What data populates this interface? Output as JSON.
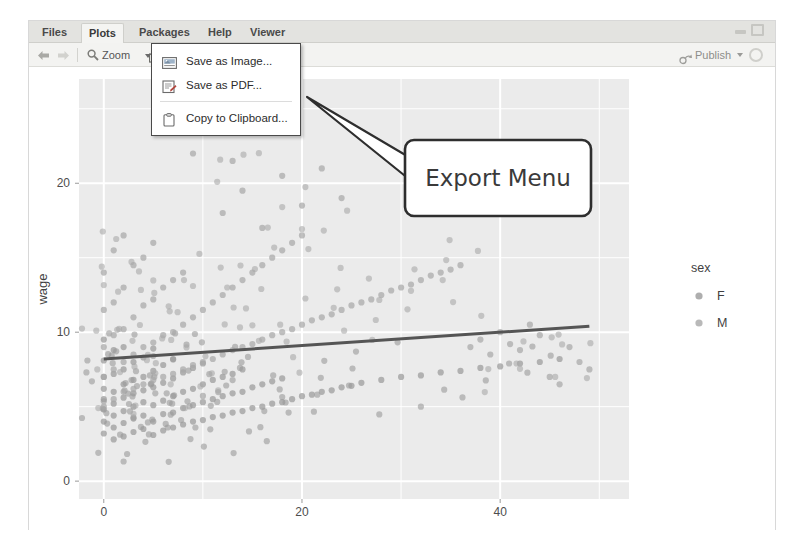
{
  "window": {
    "minimize_label": "minimize",
    "maximize_label": "maximize"
  },
  "tabs": [
    {
      "label": "Files",
      "active": false
    },
    {
      "label": "Plots",
      "active": true
    },
    {
      "label": "Packages",
      "active": false
    },
    {
      "label": "Help",
      "active": false
    },
    {
      "label": "Viewer",
      "active": false
    }
  ],
  "toolbar": {
    "back_icon": "back-arrow-icon",
    "forward_icon": "forward-arrow-icon",
    "zoom_icon": "magnifier-icon",
    "zoom_label": "Zoom",
    "export_icon": "export-icon",
    "export_label": "Export",
    "export_caret": "caret-down-icon",
    "remove_icon": "remove-plot-icon",
    "clear_icon": "clear-all-plots-icon",
    "publish_icon": "publish-icon",
    "publish_label": "Publish",
    "publish_caret": "caret-down-icon",
    "refresh_icon": "refresh-icon"
  },
  "export_menu": {
    "open": true,
    "items": [
      {
        "label": "Save as Image...",
        "icon": "image-file-icon"
      },
      {
        "label": "Save as PDF...",
        "icon": "pdf-file-icon"
      },
      {
        "label": "Copy to Clipboard...",
        "icon": "clipboard-icon"
      }
    ]
  },
  "annotation": {
    "label": "Export Menu"
  },
  "colors": {
    "panel_bg": "#ebebeb",
    "grid": "#ffffff",
    "point": "#9a9a9a",
    "trend_line": "#555555",
    "axis_text": "#4d4d4d",
    "toolbar_bg": "#f3f3f1",
    "tabbar_bg": "#e3e3e0"
  },
  "chart_data": {
    "type": "scatter",
    "title": "",
    "xlabel": "exper",
    "ylabel": "wage",
    "xlim": [
      -2.5,
      53
    ],
    "ylim": [
      -1.2,
      27
    ],
    "xticks": [
      0,
      20,
      40
    ],
    "yticks": [
      0,
      10,
      20
    ],
    "grid": true,
    "legend": {
      "title": "sex",
      "position": "right",
      "entries": [
        {
          "label": "F",
          "color": "#9a9a9a"
        },
        {
          "label": "M",
          "color": "#a8a8a8"
        }
      ]
    },
    "trend_line": {
      "type": "linear-fit",
      "x_start": 0,
      "y_start": 8.2,
      "x_end": 49,
      "y_end": 10.4,
      "color": "#555555"
    },
    "series": [
      {
        "name": "F",
        "color": "#9a9a9a",
        "x": [
          0,
          0,
          0,
          0,
          0,
          0,
          0,
          0,
          1,
          1,
          1,
          1,
          1,
          1,
          1,
          2,
          2,
          2,
          2,
          2,
          2,
          2,
          3,
          3,
          3,
          3,
          3,
          3,
          4,
          4,
          4,
          4,
          4,
          4,
          5,
          5,
          5,
          5,
          5,
          5,
          6,
          6,
          6,
          6,
          6,
          7,
          7,
          7,
          7,
          7,
          8,
          8,
          8,
          8,
          9,
          9,
          9,
          9,
          10,
          10,
          10,
          10,
          11,
          11,
          11,
          12,
          12,
          12,
          13,
          13,
          13,
          14,
          14,
          14,
          15,
          15,
          16,
          16,
          17,
          17,
          18,
          18,
          19,
          20,
          21,
          22,
          23,
          24,
          25,
          26,
          28,
          30,
          32,
          34,
          36,
          38,
          40,
          42,
          44,
          46
        ],
        "y": [
          3.2,
          4.0,
          4.8,
          5.5,
          6.2,
          7.0,
          8.1,
          9.5,
          2.8,
          3.6,
          4.4,
          5.2,
          6.0,
          7.2,
          8.8,
          3.0,
          3.9,
          4.7,
          5.6,
          6.5,
          7.5,
          9.0,
          3.3,
          4.2,
          5.0,
          5.9,
          6.8,
          8.0,
          3.5,
          4.4,
          5.3,
          6.1,
          7.0,
          8.3,
          3.1,
          4.0,
          5.1,
          6.3,
          7.4,
          8.9,
          3.4,
          4.5,
          5.4,
          6.6,
          7.8,
          3.6,
          4.6,
          5.7,
          6.9,
          8.2,
          3.8,
          4.9,
          6.0,
          7.3,
          4.0,
          5.1,
          6.2,
          7.6,
          4.1,
          5.3,
          6.5,
          7.9,
          4.3,
          5.5,
          6.8,
          4.4,
          5.7,
          7.0,
          4.6,
          5.9,
          7.2,
          4.7,
          6.0,
          7.5,
          4.9,
          6.3,
          5.0,
          6.5,
          5.2,
          6.7,
          5.3,
          6.9,
          5.5,
          5.7,
          5.8,
          6.0,
          6.1,
          6.3,
          6.4,
          6.6,
          6.8,
          7.0,
          7.1,
          7.3,
          7.4,
          7.6,
          7.7,
          7.9,
          8.0,
          8.2
        ]
      },
      {
        "name": "M",
        "color": "#a8a8a8",
        "x": [
          0,
          0,
          0,
          0,
          0,
          1,
          1,
          1,
          1,
          1,
          2,
          2,
          2,
          2,
          2,
          3,
          3,
          3,
          3,
          4,
          4,
          4,
          4,
          5,
          5,
          5,
          5,
          6,
          6,
          6,
          7,
          7,
          7,
          8,
          8,
          8,
          9,
          9,
          10,
          10,
          11,
          11,
          12,
          12,
          13,
          13,
          14,
          14,
          15,
          15,
          16,
          16,
          17,
          17,
          18,
          18,
          19,
          19,
          20,
          20,
          21,
          22,
          23,
          24,
          25,
          26,
          27,
          28,
          29,
          30,
          31,
          32,
          33,
          34,
          35,
          36,
          37,
          38,
          39,
          40,
          41,
          42,
          43,
          44,
          45,
          46,
          47,
          48,
          49,
          12,
          14,
          16,
          18,
          20,
          22,
          24,
          9,
          11,
          13,
          15
        ],
        "y": [
          5.0,
          7.0,
          9.0,
          11.5,
          14.0,
          5.5,
          7.5,
          9.8,
          12.0,
          15.5,
          6.0,
          8.0,
          10.2,
          13.0,
          16.5,
          6.2,
          8.5,
          11.0,
          14.5,
          6.5,
          9.0,
          11.8,
          15.0,
          6.8,
          9.3,
          12.2,
          16.0,
          7.0,
          9.8,
          13.0,
          7.2,
          10.0,
          13.5,
          7.5,
          10.5,
          14.0,
          7.8,
          11.0,
          8.0,
          11.5,
          8.2,
          12.0,
          8.5,
          12.5,
          8.8,
          13.0,
          9.0,
          13.5,
          9.2,
          14.0,
          9.5,
          14.5,
          9.8,
          15.0,
          10.0,
          15.5,
          10.2,
          16.0,
          10.5,
          16.5,
          10.8,
          11.0,
          11.2,
          11.5,
          11.8,
          12.0,
          12.2,
          12.5,
          12.8,
          13.0,
          13.2,
          13.5,
          13.8,
          14.0,
          14.2,
          14.5,
          9.0,
          9.5,
          8.5,
          10.0,
          9.2,
          8.8,
          10.5,
          9.8,
          7.0,
          6.5,
          9.0,
          8.0,
          7.5,
          18.0,
          19.5,
          17.0,
          20.5,
          18.5,
          21.0,
          19.0,
          22.0,
          23.5,
          21.5,
          24.5
        ]
      }
    ]
  }
}
